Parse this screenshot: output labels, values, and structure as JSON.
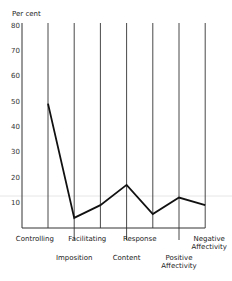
{
  "chart_data": {
    "type": "line",
    "title": "",
    "ylabel": "Per cent",
    "xlabel": "",
    "ylim": [
      0,
      80
    ],
    "yticks": [
      10,
      20,
      30,
      40,
      50,
      60,
      70,
      80
    ],
    "ytick_labels": [
      "10",
      "20",
      "30",
      "40",
      "50",
      "60",
      "70",
      "80"
    ],
    "grid": "vertical lines at each category",
    "categories": [
      "Controlling",
      "Imposition",
      "Facilitating",
      "Content",
      "Response",
      "Positive Affectivity",
      "Negative Affectivity"
    ],
    "category_labels": [
      {
        "lines": [
          "Controlling"
        ],
        "row": "upper"
      },
      {
        "lines": [
          "Imposition"
        ],
        "row": "lower"
      },
      {
        "lines": [
          "Facilitating"
        ],
        "row": "upper"
      },
      {
        "lines": [
          "Content"
        ],
        "row": "lower"
      },
      {
        "lines": [
          "Response"
        ],
        "row": "upper"
      },
      {
        "lines": [
          "Positive",
          "Affectivity"
        ],
        "row": "lower"
      },
      {
        "lines": [
          "Negative",
          "Affectivity"
        ],
        "row": "upper"
      }
    ],
    "series": [
      {
        "name": "Per cent",
        "values": [
          49,
          4,
          9,
          17,
          5.5,
          12,
          9
        ]
      }
    ]
  }
}
